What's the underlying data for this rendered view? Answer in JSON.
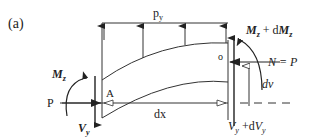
{
  "figure_label": "(a)",
  "labels": {
    "distributed_load": "p",
    "distributed_load_sub": "y",
    "moment_left": "M",
    "moment_left_sub": "z",
    "moment_right": "M",
    "moment_right_sub": "z",
    "moment_right_plus": " + d",
    "moment_right_d": "M",
    "moment_right_d_sub": "z",
    "axial_left": "P",
    "axial_right": "N = P",
    "point_left": "A",
    "point_right": "o",
    "shear_left": "V",
    "shear_left_sub": "y",
    "shear_right": "V",
    "shear_right_sub": "y",
    "shear_right_plus": " +d",
    "shear_right_d": "V",
    "shear_right_d_sub": "y",
    "length": "dx",
    "deflection": "dv"
  },
  "colors": {
    "line": "#333333",
    "background": "#ffffff"
  }
}
